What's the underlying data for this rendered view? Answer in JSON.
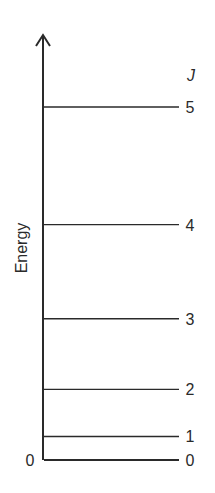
{
  "chart_data": {
    "type": "energy-level-diagram",
    "title": "",
    "ylabel": "Energy",
    "level_header": "J",
    "origin_label": "0",
    "energy_formula": "J(J+1)",
    "levels": [
      {
        "J": "0",
        "energy": 0
      },
      {
        "J": "1",
        "energy": 2
      },
      {
        "J": "2",
        "energy": 6
      },
      {
        "J": "3",
        "energy": 12
      },
      {
        "J": "4",
        "energy": 20
      },
      {
        "J": "5",
        "energy": 30
      }
    ],
    "ylim": [
      0,
      30
    ],
    "axis_arrow": true
  },
  "colors": {
    "line": "#2a2a2a",
    "background": "#ffffff"
  }
}
